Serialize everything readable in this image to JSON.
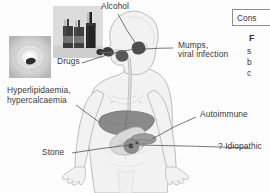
{
  "figure": {
    "background_color": "#fdfdfd",
    "label_color": "#3a3a3a"
  },
  "labels": [
    {
      "id": "alcohol",
      "text": "Alcohol",
      "name": "label-alcohol"
    },
    {
      "id": "drugs",
      "text": "Drugs",
      "name": "label-drugs"
    },
    {
      "id": "mumps_l1",
      "text": "Mumps,",
      "name": "label-mumps-line1"
    },
    {
      "id": "mumps_l2",
      "text": "viral infection",
      "name": "label-mumps-line2"
    },
    {
      "id": "hyperlip_l1",
      "text": "Hyperlipidaemia,",
      "name": "label-hyperlipidaemia-line1"
    },
    {
      "id": "hyperlip_l2",
      "text": "hypercalcaemia",
      "name": "label-hypercalcaemia-line2"
    },
    {
      "id": "stone",
      "text": "Stone",
      "name": "label-stone"
    },
    {
      "id": "autoimmune",
      "text": "Autoimmune",
      "name": "label-autoimmune"
    },
    {
      "id": "idiopathic",
      "text": "? Idiopathic",
      "name": "label-idiopathic"
    }
  ],
  "side_panel": {
    "box_label": "Cons",
    "heading": "F",
    "line1": "s",
    "line2": "b",
    "line3": "c"
  },
  "photos": {
    "bottles_alt": "alcohol-bottles-photograph",
    "stone_alt": "gallstone-photograph"
  },
  "anatomy": {
    "body_fill": "#f2f2f2",
    "body_stroke": "#b4b4b4",
    "liver_fill": "#8c8c8c",
    "stomach_fill": "#d4d4d4",
    "pancreas_fill": "#9a9a9a",
    "gland_fill": "#5a5a5a",
    "duct_fill": "#cfcfcf"
  }
}
